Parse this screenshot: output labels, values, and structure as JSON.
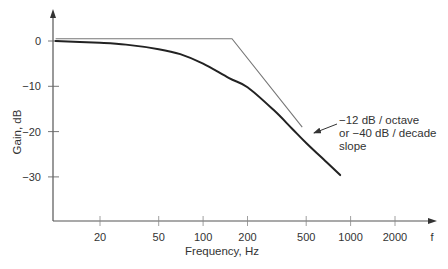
{
  "chart_data": {
    "type": "line",
    "title": "",
    "xlabel": "Frequency, Hz",
    "ylabel": "Gain, dB",
    "x_axis_end_label": "f",
    "x_scale": "log",
    "x_ticks": [
      20,
      50,
      100,
      200,
      500,
      1000,
      2000
    ],
    "x_tick_labels": [
      "20",
      "50",
      "100",
      "200",
      "500",
      "1000",
      "2000"
    ],
    "y_ticks": [
      0,
      -10,
      -20,
      -30
    ],
    "y_tick_labels": [
      "0",
      "−10",
      "−20",
      "−30"
    ],
    "xlim": [
      10,
      3500
    ],
    "ylim": [
      -39,
      8
    ],
    "grid": false,
    "series": [
      {
        "name": "Actual response",
        "style": "thick dark curve",
        "color": "#222222",
        "x": [
          10,
          20,
          30,
          50,
          70,
          100,
          150,
          200,
          300,
          400,
          500,
          700,
          850
        ],
        "y": [
          0,
          -0.4,
          -0.8,
          -1.8,
          -2.9,
          -5.0,
          -8.2,
          -10.2,
          -15.2,
          -19.3,
          -22.5,
          -27.0,
          -29.6
        ]
      },
      {
        "name": "Asymptotic approximation",
        "style": "thin gray straight lines",
        "color": "#777777",
        "x": [
          10,
          157,
          470
        ],
        "y": [
          0.5,
          0.5,
          -19.0
        ]
      }
    ],
    "annotations": [
      {
        "lines": [
          "−12 dB / octave",
          "or −40 dB / decade",
          "slope"
        ],
        "arrow_target": {
          "x": 520,
          "y": -20.5
        }
      }
    ]
  }
}
